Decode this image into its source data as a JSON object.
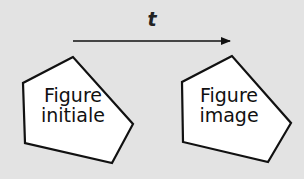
{
  "diagram": {
    "vector_label": "t",
    "background_color": "#e3e3e3",
    "stroke_color": "#111111",
    "fill_color": "#ffffff",
    "initial_figure": {
      "line1": "Figure",
      "line2": "initiale",
      "points": "73,57 23,83 25,143 112,163 133,124"
    },
    "image_figure": {
      "line1": "Figure",
      "line2": "image",
      "points": "232,56 182,82 183,142 268,162 291,123"
    },
    "arrow": {
      "x1": 73,
      "y1": 41,
      "x2": 230,
      "y2": 41
    }
  }
}
